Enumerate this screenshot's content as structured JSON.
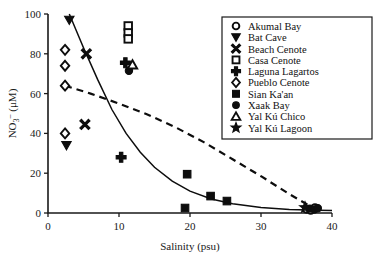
{
  "chart_data": {
    "type": "scatter",
    "title": "",
    "xlabel": "Salinity (psu)",
    "ylabel": "NO3- (uM)",
    "ylabel_parts": {
      "base": "NO",
      "sub": "3",
      "sup": "–",
      "unit": " (μM)"
    },
    "xlim": [
      0,
      40
    ],
    "ylim": [
      0,
      100
    ],
    "xticks": [
      0,
      10,
      20,
      30,
      40
    ],
    "yticks": [
      0,
      20,
      40,
      60,
      80,
      100
    ],
    "grid": false,
    "legend_position": "right-outside",
    "series": [
      {
        "name": "Akumal Bay",
        "marker": "circle-open",
        "points": [
          [
            36.4,
            2.0
          ],
          [
            37.0,
            1.4
          ],
          [
            37.6,
            2.6
          ]
        ]
      },
      {
        "name": "Bat Cave",
        "marker": "triangle-down-filled",
        "points": [
          [
            3.0,
            97.0
          ],
          [
            2.6,
            34.0
          ]
        ]
      },
      {
        "name": "Beach Cenote",
        "marker": "x-filled",
        "points": [
          [
            5.4,
            80.0
          ],
          [
            5.2,
            44.5
          ]
        ]
      },
      {
        "name": "Casa Cenote",
        "marker": "square-open",
        "points": [
          [
            11.3,
            94.0
          ],
          [
            11.3,
            90.5
          ],
          [
            11.3,
            87.5
          ]
        ]
      },
      {
        "name": "Laguna Lagartos",
        "marker": "plus-filled",
        "points": [
          [
            10.9,
            75.5
          ],
          [
            10.3,
            28.0
          ]
        ]
      },
      {
        "name": "Pueblo Cenote",
        "marker": "diamond-open",
        "points": [
          [
            2.4,
            82.0
          ],
          [
            2.4,
            74.0
          ],
          [
            2.4,
            64.0
          ],
          [
            2.4,
            40.0
          ]
        ]
      },
      {
        "name": "Sian Ka'an",
        "marker": "square-filled",
        "points": [
          [
            19.6,
            19.5
          ],
          [
            22.9,
            8.5
          ],
          [
            25.2,
            6.0
          ],
          [
            19.3,
            2.5
          ]
        ]
      },
      {
        "name": "Xaak Bay",
        "marker": "circle-filled",
        "points": [
          [
            11.4,
            71.5
          ],
          [
            36.9,
            2.2
          ],
          [
            37.5,
            1.8
          ],
          [
            38.0,
            2.4
          ]
        ]
      },
      {
        "name": "Yal Ku Chico",
        "marker": "triangle-up-open",
        "points": [
          [
            11.9,
            74.5
          ]
        ]
      },
      {
        "name": "Yal Ku Lagoon",
        "marker": "star-filled",
        "points": [
          [
            36.2,
            2.8
          ]
        ]
      }
    ],
    "curves": [
      {
        "name": "solid-mixing-curve",
        "style": "solid",
        "points": [
          [
            3.0,
            100.0
          ],
          [
            5.0,
            83.0
          ],
          [
            7.0,
            67.0
          ],
          [
            9.0,
            52.0
          ],
          [
            11.0,
            40.0
          ],
          [
            13.0,
            30.5
          ],
          [
            15.0,
            23.0
          ],
          [
            17.5,
            16.0
          ],
          [
            20.0,
            11.0
          ],
          [
            23.0,
            7.0
          ],
          [
            26.0,
            4.6
          ],
          [
            30.0,
            2.8
          ],
          [
            34.0,
            1.8
          ],
          [
            38.0,
            1.4
          ],
          [
            40.0,
            1.3
          ]
        ]
      },
      {
        "name": "dashed-conservative-mixing-line",
        "style": "dashed",
        "points": [
          [
            2.4,
            64.0
          ],
          [
            6.0,
            60.0
          ],
          [
            10.0,
            55.0
          ],
          [
            14.0,
            49.5
          ],
          [
            18.0,
            43.0
          ],
          [
            22.0,
            35.5
          ],
          [
            26.0,
            27.0
          ],
          [
            30.0,
            18.5
          ],
          [
            34.0,
            9.5
          ],
          [
            37.5,
            2.2
          ]
        ]
      }
    ]
  },
  "legend": {
    "items": [
      {
        "label": "Akumal Bay",
        "marker": "circle-open"
      },
      {
        "label": "Bat Cave",
        "marker": "triangle-down-filled"
      },
      {
        "label": "Beach Cenote",
        "marker": "x-filled"
      },
      {
        "label": "Casa Cenote",
        "marker": "square-open"
      },
      {
        "label": "Laguna Lagartos",
        "marker": "plus-filled"
      },
      {
        "label": "Pueblo Cenote",
        "marker": "diamond-open"
      },
      {
        "label": "Sian Ka'an",
        "marker": "square-filled"
      },
      {
        "label": "Xaak Bay",
        "marker": "circle-filled"
      },
      {
        "label": "Yal Kú Chico",
        "marker": "triangle-up-open"
      },
      {
        "label": "Yal Kú Lagoon",
        "marker": "star-filled"
      }
    ]
  }
}
